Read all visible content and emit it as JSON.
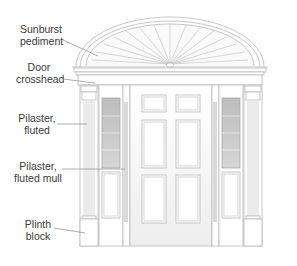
{
  "diagram": {
    "labels": [
      {
        "id": "sunburst-pediment",
        "line1": "Sunburst",
        "line2": "pediment"
      },
      {
        "id": "door-crosshead",
        "line1": "Door",
        "line2": "crosshead"
      },
      {
        "id": "pilaster-fluted",
        "line1": "Pilaster,",
        "line2": "fluted"
      },
      {
        "id": "pilaster-fluted-mull",
        "line1": "Pilaster,",
        "line2": "fluted mull"
      },
      {
        "id": "plinth-block",
        "line1": "Plinth",
        "line2": "block"
      }
    ],
    "colors": {
      "line": "#b8b8b8",
      "line_dark": "#9a9a9a",
      "glass": "#c4c4c4",
      "glass_light": "#dcdcdc",
      "text": "#3a3a3a",
      "leader": "#8a8a8a"
    }
  }
}
